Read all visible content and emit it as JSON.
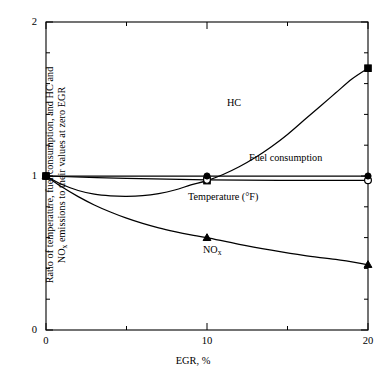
{
  "chart_data": {
    "type": "line",
    "title": "",
    "xlabel": "EGR, %",
    "ylabel_line1": "Ratio of temperature, fuel consumption, and HC and",
    "ylabel_line2_pre": "NO",
    "ylabel_line2_sub": "x",
    "ylabel_line2_post": " emissions to their values at zero EGR",
    "xlim": [
      0,
      20
    ],
    "ylim": [
      0,
      2
    ],
    "xticks": [
      0,
      10,
      20
    ],
    "xtick_labels": [
      "0",
      "10",
      "20"
    ],
    "xminor_ticks": [
      5,
      15
    ],
    "yticks": [
      0,
      1,
      2
    ],
    "ytick_labels": [
      "0",
      "1",
      "2"
    ],
    "yminor_step": 0.2,
    "grid": false,
    "legend_position": "inline-annotations",
    "series": [
      {
        "name": "HC",
        "marker": "filled-square",
        "label": "HC",
        "label_x": 11.2,
        "label_y": 1.37,
        "x": [
          0,
          1,
          2,
          3,
          4,
          5,
          6,
          7,
          8,
          9,
          10,
          11,
          12,
          13,
          14,
          15,
          16,
          17,
          18,
          19,
          20
        ],
        "y": [
          1.0,
          0.945,
          0.906,
          0.882,
          0.871,
          0.868,
          0.872,
          0.886,
          0.909,
          0.942,
          0.97,
          1.01,
          1.06,
          1.12,
          1.19,
          1.27,
          1.36,
          1.45,
          1.54,
          1.63,
          1.7
        ],
        "marker_x": [
          0,
          10,
          20
        ],
        "marker_y": [
          1.0,
          0.97,
          1.7
        ]
      },
      {
        "name": "Fuel consumption",
        "marker": "open-circle",
        "label": "Fuel consumption",
        "label_x": 12.0,
        "label_y": 1.08,
        "x": [
          0,
          5,
          10,
          15,
          20
        ],
        "y": [
          1.0,
          0.985,
          0.975,
          0.972,
          0.972
        ],
        "marker_x": [
          0,
          10,
          20
        ],
        "marker_y": [
          1.0,
          0.975,
          0.972
        ]
      },
      {
        "name": "Temperature (°F)",
        "marker": "filled-circle",
        "label": "Temperature (°F)",
        "label_x": 8.6,
        "label_y": 0.84,
        "x": [
          0,
          5,
          10,
          15,
          20
        ],
        "y": [
          1.0,
          1.0,
          1.0,
          1.0,
          1.0
        ],
        "marker_x": [
          0,
          10,
          20
        ],
        "marker_y": [
          1.0,
          1.0,
          1.0
        ]
      },
      {
        "name": "NOx",
        "marker": "filled-triangle",
        "label_pre": "NO",
        "label_sub": "x",
        "label_x": 10.0,
        "label_y": 0.44,
        "x": [
          0,
          1,
          2,
          3,
          4,
          5,
          6,
          7,
          8,
          9,
          10,
          12,
          14,
          16,
          18,
          20
        ],
        "y": [
          1.0,
          0.928,
          0.866,
          0.812,
          0.766,
          0.726,
          0.692,
          0.663,
          0.639,
          0.618,
          0.6,
          0.556,
          0.518,
          0.484,
          0.458,
          0.425
        ],
        "marker_x": [
          0,
          10,
          20
        ],
        "marker_y": [
          1.0,
          0.6,
          0.425
        ]
      }
    ]
  }
}
